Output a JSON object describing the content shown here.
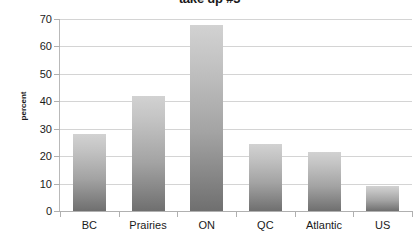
{
  "chart_data": {
    "type": "bar",
    "title": "take up #3",
    "xlabel": "",
    "ylabel": "percent",
    "categories": [
      "BC",
      "Prairies",
      "ON",
      "QC",
      "Atlantic",
      "US"
    ],
    "values": [
      28,
      42,
      68,
      24.5,
      21.5,
      9
    ],
    "ylim": [
      0,
      70
    ],
    "ytick_labels": [
      "0",
      "10",
      "20",
      "30",
      "40",
      "50",
      "60",
      "70"
    ],
    "ytick_values": [
      0,
      10,
      20,
      30,
      40,
      50,
      60,
      70
    ],
    "grid": true,
    "legend": false,
    "series": [
      {
        "name": "percent",
        "values": [
          28,
          42,
          68,
          24.5,
          21.5,
          9
        ]
      }
    ]
  },
  "colors": {
    "bar_top": "#d2d2d2",
    "bar_bottom": "#6f6f6f",
    "gridline": "#d4d4d4",
    "axis": "#b0b0b0",
    "text": "#1a1a1a",
    "background": "#ffffff"
  }
}
